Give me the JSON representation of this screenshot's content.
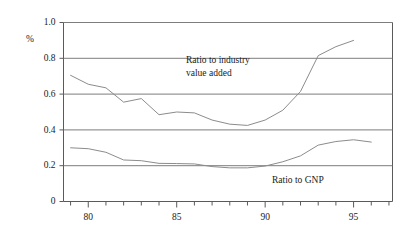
{
  "chart_data": {
    "type": "line",
    "title": "",
    "subtitle": "",
    "xlabel": "",
    "ylabel": "%",
    "unit_label": "%",
    "xlim": [
      78.6,
      97.2
    ],
    "ylim": [
      0,
      1.0
    ],
    "grid": true,
    "grid_axis": "y",
    "legend": "inline-annotations",
    "yticks": [
      0,
      0.2,
      0.4,
      0.6,
      0.8,
      1.0
    ],
    "ytick_labels": [
      "0",
      "0.2",
      "0.4",
      "0.6",
      "0.8",
      "1.0"
    ],
    "xticks": [
      79,
      80,
      81,
      82,
      83,
      84,
      85,
      86,
      87,
      88,
      89,
      90,
      91,
      92,
      93,
      94,
      95,
      96,
      97
    ],
    "xtick_labels_shown": [
      "80",
      "85",
      "90",
      "95"
    ],
    "xtick_label_values": [
      80,
      85,
      90,
      95
    ],
    "x": [
      79,
      80,
      81,
      82,
      83,
      84,
      85,
      86,
      87,
      88,
      89,
      90,
      91,
      92,
      93,
      94,
      95,
      96
    ],
    "series": [
      {
        "name": "Ratio to industry value added",
        "annotation": "Ratio to industry\nvalue added",
        "annotation_line1": "Ratio to industry",
        "annotation_line2": "value added",
        "values": [
          0.705,
          0.655,
          0.635,
          0.555,
          0.575,
          0.485,
          0.5,
          0.495,
          0.455,
          0.432,
          0.425,
          0.455,
          0.51,
          0.615,
          0.815,
          0.865,
          0.9,
          null
        ]
      },
      {
        "name": "Ratio to GNP",
        "annotation": "Ratio to GNP",
        "annotation_line1": "Ratio to GNP",
        "values": [
          0.3,
          0.295,
          0.275,
          0.232,
          0.228,
          0.213,
          0.212,
          0.21,
          0.195,
          0.188,
          0.188,
          0.198,
          0.222,
          0.255,
          0.315,
          0.335,
          0.345,
          0.332
        ]
      }
    ]
  },
  "annotations": {
    "industry": {
      "line1": "Ratio to industry",
      "line2": "value added"
    },
    "gnp": {
      "line1": "Ratio to GNP"
    }
  },
  "axis": {
    "unit": "%",
    "y_labels": [
      "1.0",
      "0.8",
      "0.6",
      "0.4",
      "0.2",
      "0"
    ],
    "x_labels": [
      "80",
      "85",
      "90",
      "95"
    ]
  },
  "colors": {
    "line": "#8c8c8c",
    "grid": "#7d7d7d",
    "axis": "#5a5a5a",
    "text": "#1a1a1a",
    "background": "#ffffff"
  }
}
